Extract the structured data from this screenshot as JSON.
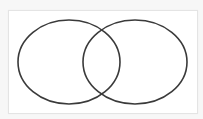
{
  "diagram": {
    "type": "venn",
    "sets": [
      {
        "name": "left-set",
        "label": ""
      },
      {
        "name": "right-set",
        "label": ""
      }
    ],
    "colors": {
      "stroke": "#3a3a3a",
      "fill": "none",
      "frame_border": "#e4e4e4",
      "background": "#ffffff"
    }
  }
}
